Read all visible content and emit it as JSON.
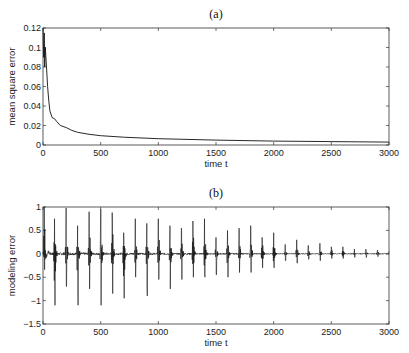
{
  "chart_data": [
    {
      "type": "line",
      "title": "(a)",
      "xlabel": "time t",
      "ylabel": "mean square error",
      "xlim": [
        0,
        3000
      ],
      "ylim": [
        0,
        0.12
      ],
      "xticks": [
        0,
        500,
        1000,
        1500,
        2000,
        2500,
        3000
      ],
      "yticks": [
        0,
        0.02,
        0.04,
        0.06,
        0.08,
        0.1,
        0.12
      ],
      "ytick_labels": [
        "0",
        "0.02",
        "0.04",
        "0.06",
        "0.08",
        "0.1",
        "0.12"
      ],
      "grid": false,
      "series": [
        {
          "name": "mse",
          "x": [
            0,
            5,
            10,
            15,
            20,
            30,
            40,
            50,
            60,
            80,
            100,
            120,
            150,
            200,
            250,
            300,
            400,
            500,
            700,
            1000,
            1500,
            2000,
            2500,
            3000
          ],
          "y": [
            0.12,
            0.09,
            0.115,
            0.08,
            0.1,
            0.08,
            0.06,
            0.045,
            0.035,
            0.028,
            0.027,
            0.024,
            0.02,
            0.018,
            0.015,
            0.013,
            0.011,
            0.0095,
            0.008,
            0.0065,
            0.005,
            0.004,
            0.0035,
            0.003
          ]
        }
      ]
    },
    {
      "type": "line",
      "title": "(b)",
      "xlabel": "time t",
      "ylabel": "modeling error",
      "xlim": [
        0,
        3000
      ],
      "ylim": [
        -1.5,
        1
      ],
      "xticks": [
        0,
        500,
        1000,
        1500,
        2000,
        2500,
        3000
      ],
      "yticks": [
        -1.5,
        -1,
        -0.5,
        0,
        0.5,
        1
      ],
      "ytick_labels": [
        "-1.5",
        "-1",
        "-0.5",
        "0",
        "0.5",
        "1"
      ],
      "grid": false,
      "description": "oscillating error with burst spikes roughly every 100 time steps, decaying amplitude",
      "bursts": {
        "t": [
          10,
          100,
          200,
          300,
          400,
          500,
          600,
          700,
          800,
          900,
          1000,
          1100,
          1200,
          1300,
          1400,
          1500,
          1600,
          1700,
          1800,
          1900,
          2000,
          2100,
          2200,
          2300,
          2400,
          2500,
          2600,
          2700,
          2800,
          2900,
          3000
        ],
        "max": [
          0.95,
          0.75,
          0.98,
          0.6,
          0.9,
          0.95,
          0.88,
          0.45,
          0.75,
          0.65,
          0.75,
          0.6,
          0.55,
          0.7,
          0.75,
          0.35,
          0.5,
          0.55,
          0.6,
          0.35,
          0.45,
          0.2,
          0.3,
          0.18,
          0.22,
          0.15,
          0.15,
          0.1,
          0.1,
          0.08,
          0.05
        ],
        "min": [
          -0.4,
          -1.1,
          -0.7,
          -1.1,
          -0.75,
          -1.1,
          -0.85,
          -0.95,
          -0.5,
          -0.9,
          -0.55,
          -0.75,
          -0.55,
          -0.5,
          -0.5,
          -0.45,
          -0.5,
          -0.4,
          -0.4,
          -0.3,
          -0.3,
          -0.15,
          -0.2,
          -0.12,
          -0.15,
          -0.1,
          -0.1,
          -0.08,
          -0.08,
          -0.06,
          -0.05
        ]
      }
    }
  ]
}
